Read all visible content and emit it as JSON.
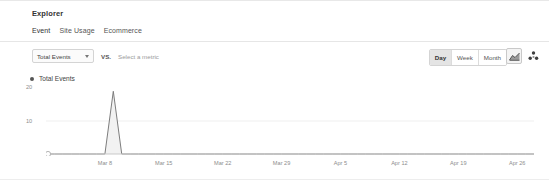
{
  "panel": {
    "title": "Explorer"
  },
  "tabs": [
    {
      "label": "Event",
      "active": true
    },
    {
      "label": "Site Usage",
      "active": false
    },
    {
      "label": "Ecommerce",
      "active": false
    }
  ],
  "controls": {
    "metric_selected": "Total Events",
    "vs_label": "VS.",
    "compare_placeholder": "Select a metric",
    "granularity": [
      {
        "label": "Day",
        "active": true
      },
      {
        "label": "Week",
        "active": false
      },
      {
        "label": "Month",
        "active": false
      }
    ],
    "icons": [
      {
        "name": "area-chart-icon",
        "selected": true
      },
      {
        "name": "scatter-chart-icon",
        "selected": false
      }
    ]
  },
  "legend": {
    "series_label": "Total Events",
    "color": "#555555"
  },
  "chart_data": {
    "type": "line",
    "title": "Total Events",
    "xlabel": "",
    "ylabel": "",
    "grid": true,
    "legend_position": "top-left",
    "ylim": [
      0,
      20
    ],
    "ytick_labels": [
      "20",
      "10"
    ],
    "ytick_values": [
      20,
      10
    ],
    "xtick_labels": [
      "Mar 8",
      "Mar 15",
      "Mar 22",
      "Mar 29",
      "Apr 5",
      "Apr 12",
      "Apr 19",
      "Apr 26"
    ],
    "series": [
      {
        "name": "Total Events",
        "color": "#7d7d7d",
        "fill": "#f2f2f2",
        "x": [
          "Mar 1",
          "Mar 2",
          "Mar 3",
          "Mar 4",
          "Mar 5",
          "Mar 6",
          "Mar 7",
          "Mar 8",
          "Mar 9",
          "Mar 10",
          "Mar 11",
          "Mar 12",
          "Mar 13",
          "Mar 14",
          "Mar 15",
          "Mar 16",
          "Mar 17",
          "Mar 18",
          "Mar 19",
          "Mar 20",
          "Mar 21",
          "Mar 22",
          "Mar 23",
          "Mar 24",
          "Mar 25",
          "Mar 26",
          "Mar 27",
          "Mar 28",
          "Mar 29",
          "Mar 30",
          "Mar 31",
          "Apr 1",
          "Apr 2",
          "Apr 3",
          "Apr 4",
          "Apr 5",
          "Apr 6",
          "Apr 7",
          "Apr 8",
          "Apr 9",
          "Apr 10",
          "Apr 11",
          "Apr 12",
          "Apr 13",
          "Apr 14",
          "Apr 15",
          "Apr 16",
          "Apr 17",
          "Apr 18",
          "Apr 19",
          "Apr 20",
          "Apr 21",
          "Apr 22",
          "Apr 23",
          "Apr 24",
          "Apr 25",
          "Apr 26",
          "Apr 27",
          "Apr 28"
        ],
        "values": [
          0,
          0,
          0,
          0,
          0,
          0,
          0,
          0,
          19,
          0,
          0,
          0,
          0,
          0,
          0,
          0,
          0,
          0,
          0,
          0,
          0,
          0,
          0,
          0,
          0,
          0,
          0,
          0,
          0,
          0,
          0,
          0,
          0,
          0,
          0,
          0,
          0,
          0,
          0,
          0,
          0,
          0,
          0,
          0,
          0,
          0,
          0,
          0,
          0,
          0,
          0,
          0,
          0,
          0,
          0,
          0,
          0,
          0,
          0
        ]
      }
    ],
    "peak": {
      "label": "Mar 9",
      "value": 19
    },
    "marker_point": {
      "label": "Mar 1",
      "value": 0
    }
  }
}
